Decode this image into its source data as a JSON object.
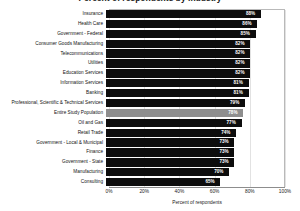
{
  "chart_data": {
    "type": "bar",
    "orientation": "horizontal",
    "title": "Percent of respondents by industry",
    "xlabel": "Percent of respondents",
    "ylabel": "",
    "xlim": [
      0,
      100
    ],
    "xticks": [
      "0%",
      "20%",
      "40%",
      "60%",
      "80%",
      "100%"
    ],
    "xtick_values": [
      0,
      20,
      40,
      60,
      80,
      100
    ],
    "grid": true,
    "legend": "none",
    "categories": [
      "Insurance",
      "Health Care",
      "Government - Federal",
      "Consumer Goods Manufacturing",
      "Telecommunications",
      "Utilities",
      "Education Services",
      "Information Services",
      "Banking",
      "Professional, Scientific & Technical Services",
      "Entire Study Population",
      "Oil and Gas",
      "Retail Trade",
      "Government - Local & Municipal",
      "Finance",
      "Government - State",
      "Manufacturing",
      "Consulting"
    ],
    "values": [
      88,
      86,
      85,
      82,
      82,
      82,
      82,
      81,
      81,
      79,
      78,
      77,
      74,
      73,
      73,
      73,
      70,
      65
    ],
    "value_labels": [
      "88%",
      "86%",
      "85%",
      "82%",
      "82%",
      "82%",
      "82%",
      "81%",
      "81%",
      "79%",
      "78%",
      "77%",
      "74%",
      "73%",
      "73%",
      "73%",
      "70%",
      "65%"
    ],
    "highlight_index": 10,
    "colors": {
      "bar": "#0d0d0d",
      "highlight_bar": "#8e8e8e",
      "value_text": "#ffffff",
      "grid": "#e2e2e2",
      "axis": "#8d8d8d",
      "text": "#111111"
    }
  }
}
